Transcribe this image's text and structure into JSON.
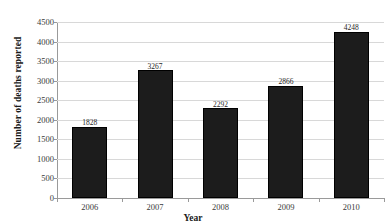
{
  "chart_data": {
    "type": "bar",
    "title": "",
    "xlabel": "Year",
    "ylabel": "Number of deaths reported",
    "categories": [
      "2006",
      "2007",
      "2008",
      "2009",
      "2010"
    ],
    "values": [
      1828,
      3267,
      2292,
      2866,
      4248
    ],
    "value_labels": [
      "1828",
      "3267",
      "2292",
      "2866",
      "4248"
    ],
    "ylim": [
      0,
      4500
    ],
    "ytick_values": [
      0,
      500,
      1000,
      1500,
      2000,
      2500,
      3000,
      3500,
      4000,
      4500
    ],
    "ytick_labels": [
      "0",
      "500",
      "1000",
      "1500",
      "2000",
      "2500",
      "3000",
      "3500",
      "4000",
      "4500"
    ],
    "grid": "horizontal",
    "legend": "none",
    "bar_color": "#1c1c1c",
    "grid_color": "#d8d8d8",
    "axis_color": "#9a9a9a"
  }
}
